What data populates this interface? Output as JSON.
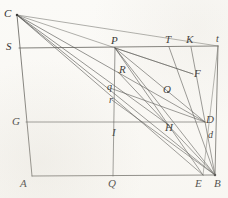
{
  "figure": {
    "background_color": "#fbfaf7",
    "ink_color": "#4a4a48",
    "width": 228,
    "height": 198
  },
  "points": [
    {
      "id": "C",
      "label": "C",
      "x": 17,
      "y": 15,
      "label_x": 4,
      "label_y": 8,
      "case": "cap"
    },
    {
      "id": "S",
      "label": "S",
      "x": 19,
      "y": 48,
      "label_x": 6,
      "label_y": 41,
      "case": "cap"
    },
    {
      "id": "P",
      "label": "P",
      "x": 115,
      "y": 48,
      "label_x": 111,
      "label_y": 35,
      "case": "cap"
    },
    {
      "id": "T",
      "label": "T",
      "x": 169,
      "y": 47,
      "label_x": 165,
      "label_y": 34,
      "case": "cap"
    },
    {
      "id": "K",
      "label": "K",
      "x": 191,
      "y": 47,
      "label_x": 186,
      "label_y": 34,
      "case": "cap"
    },
    {
      "id": "t",
      "label": "t",
      "x": 218,
      "y": 46,
      "label_x": 216,
      "label_y": 34,
      "case": "low"
    },
    {
      "id": "R",
      "label": "R",
      "x": 118,
      "y": 72,
      "label_x": 119,
      "label_y": 64,
      "case": "cap"
    },
    {
      "id": "q",
      "label": "q",
      "x": 110,
      "y": 88,
      "label_x": 107,
      "label_y": 82,
      "case": "low"
    },
    {
      "id": "r",
      "label": "r",
      "x": 112,
      "y": 100,
      "label_x": 109,
      "label_y": 95,
      "case": "low"
    },
    {
      "id": "O",
      "label": "O",
      "x": 168,
      "y": 92,
      "label_x": 163,
      "label_y": 84,
      "case": "cap"
    },
    {
      "id": "F",
      "label": "F",
      "x": 193,
      "y": 74,
      "label_x": 194,
      "label_y": 68,
      "case": "cap"
    },
    {
      "id": "G",
      "label": "G",
      "x": 26,
      "y": 122,
      "label_x": 12,
      "label_y": 116,
      "case": "cap"
    },
    {
      "id": "I",
      "label": "I",
      "x": 114,
      "y": 122,
      "label_x": 112,
      "label_y": 127,
      "case": "cap"
    },
    {
      "id": "H",
      "label": "H",
      "x": 170,
      "y": 126,
      "label_x": 165,
      "label_y": 122,
      "case": "cap"
    },
    {
      "id": "D",
      "label": "D",
      "x": 205,
      "y": 122,
      "label_x": 206,
      "label_y": 114,
      "case": "cap"
    },
    {
      "id": "d",
      "label": "d",
      "x": 209,
      "y": 134,
      "label_x": 208,
      "label_y": 130,
      "case": "low"
    },
    {
      "id": "A",
      "label": "A",
      "x": 32,
      "y": 176,
      "label_x": 20,
      "label_y": 178,
      "case": "cap"
    },
    {
      "id": "Q",
      "label": "Q",
      "x": 113,
      "y": 176,
      "label_x": 108,
      "label_y": 178,
      "case": "cap"
    },
    {
      "id": "E",
      "label": "E",
      "x": 203,
      "y": 175,
      "label_x": 195,
      "label_y": 178,
      "case": "cap"
    },
    {
      "id": "B",
      "label": "B",
      "x": 215,
      "y": 175,
      "label_x": 214,
      "label_y": 178,
      "case": "cap"
    }
  ],
  "segments": [
    {
      "name": "line-C-A",
      "from": "C",
      "to": "A",
      "style": "frame"
    },
    {
      "name": "line-A-B",
      "from": "A",
      "to": "B",
      "style": "frame"
    },
    {
      "name": "line-S-t",
      "from": "S",
      "to": "t",
      "style": "frame"
    },
    {
      "name": "line-t-B",
      "from": "t",
      "to": "B",
      "style": "frame"
    },
    {
      "name": "line-G-D",
      "from": "G",
      "to": "D",
      "style": "plain"
    },
    {
      "name": "line-P-Q",
      "from": "P",
      "to": "Q",
      "style": "plain"
    },
    {
      "name": "line-C-B",
      "from": "C",
      "to": "B",
      "style": "plain"
    },
    {
      "name": "line-C-E",
      "from": "C",
      "to": "E",
      "style": "plain"
    },
    {
      "name": "line-C-D",
      "from": "C",
      "to": "D",
      "style": "plain"
    },
    {
      "name": "line-C-H",
      "from": "C",
      "to": "H",
      "style": "plain"
    },
    {
      "name": "line-C-t",
      "from": "C",
      "to": "t",
      "style": "faint"
    },
    {
      "name": "line-C-F",
      "from": "C",
      "to": "F",
      "style": "faint"
    },
    {
      "name": "line-P-B",
      "from": "P",
      "to": "B",
      "style": "plain"
    },
    {
      "name": "line-P-E",
      "from": "P",
      "to": "E",
      "style": "plain"
    },
    {
      "name": "line-P-D",
      "from": "P",
      "to": "D",
      "style": "plain"
    },
    {
      "name": "line-P-F",
      "from": "P",
      "to": "F",
      "style": "plain"
    },
    {
      "name": "line-T-B",
      "from": "T",
      "to": "B",
      "style": "plain"
    },
    {
      "name": "line-K-B",
      "from": "K",
      "to": "B",
      "style": "plain"
    },
    {
      "name": "line-q-D",
      "from": "q",
      "to": "D",
      "style": "plain"
    },
    {
      "name": "line-r-B",
      "from": "r",
      "to": "B",
      "style": "plain"
    },
    {
      "name": "line-R-B",
      "from": "R",
      "to": "B",
      "style": "plain"
    },
    {
      "name": "line-E-B-right",
      "from": "E",
      "to": "t",
      "style": "faint"
    }
  ]
}
